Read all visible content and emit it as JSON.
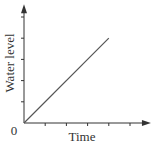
{
  "chart_data": {
    "type": "line",
    "title": "",
    "xlabel": "Time",
    "ylabel": "Water level",
    "origin_label": "0",
    "x_ticks": 5,
    "y_ticks": 5,
    "xlim": [
      0,
      5.8
    ],
    "ylim": [
      0,
      5.6
    ],
    "grid": false,
    "legend": null,
    "series": [
      {
        "name": "Water level",
        "x": [
          0,
          4
        ],
        "y": [
          0,
          4
        ],
        "color": "#555555"
      }
    ]
  },
  "colors": {
    "axis": "#333333",
    "line": "#555555",
    "background": "#ffffff"
  }
}
